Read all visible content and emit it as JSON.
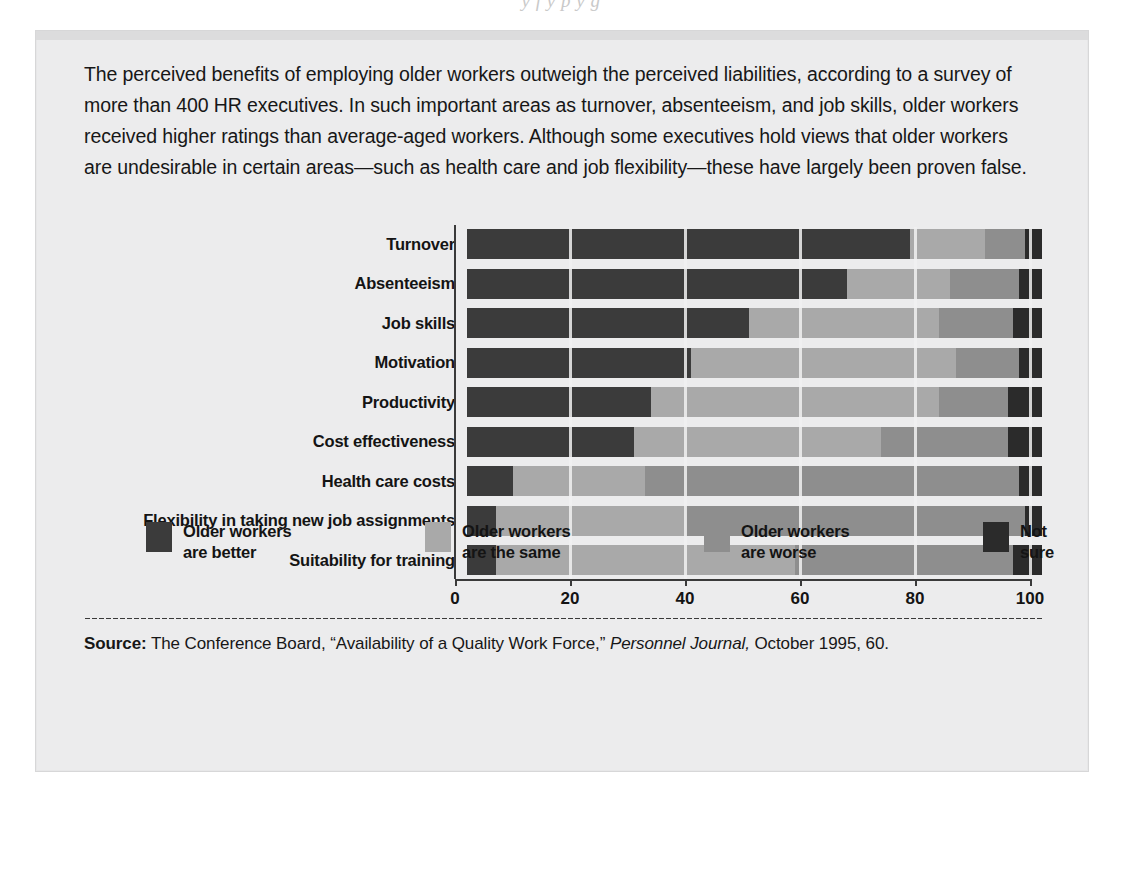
{
  "top_cut_text": "y  f  y  p  y  g",
  "intro": "The perceived benefits of employing older workers outweigh the perceived liabilities, according to a survey of more than 400 HR executives. In such important areas as turnover, absenteeism, and job skills, older workers received higher ratings than average-aged workers. Although some executives hold views that older workers are undesirable in certain areas—such as health care and job flexibility—these have largely  been proven false.",
  "legend": [
    {
      "label": "Older workers\nare better",
      "color": "#3b3b3b",
      "key": "better"
    },
    {
      "label": "Older workers\nare the same",
      "color": "#a9a9a9",
      "key": "same"
    },
    {
      "label": "Older workers\nare worse",
      "color": "#8e8e8e",
      "key": "worse"
    },
    {
      "label": "Not sure",
      "color": "#2b2b2b",
      "key": "notsure"
    }
  ],
  "source": {
    "prefix": "Source:",
    "part1": " The Conference Board, “Availability of a Quality Work Force,” ",
    "italic": "Personnel Journal,",
    "part2": " October 1995,  60."
  },
  "chart_data": {
    "type": "bar",
    "orientation": "horizontal",
    "stacked": true,
    "title": "",
    "xlabel": "",
    "ylabel": "",
    "xlim": [
      0,
      100
    ],
    "xticks": [
      0,
      20,
      40,
      60,
      80,
      100
    ],
    "xtick_labels": [
      "0",
      "20",
      "40",
      "60",
      "80",
      "100"
    ],
    "grid": false,
    "legend_position": "bottom",
    "categories": [
      "Turnover",
      "Absenteeism",
      "Job skills",
      "Motivation",
      "Productivity",
      "Cost effectiveness",
      "Health care costs",
      "Flexibility in taking new job assignments",
      "Suitability for training"
    ],
    "series": [
      {
        "name": "Older workers are better",
        "color": "#3b3b3b",
        "values": [
          77,
          66,
          49,
          39,
          32,
          29,
          8,
          5,
          5
        ]
      },
      {
        "name": "Older workers are the same",
        "color": "#a9a9a9",
        "values": [
          13,
          18,
          33,
          46,
          50,
          43,
          23,
          33,
          52
        ]
      },
      {
        "name": "Older workers are worse",
        "color": "#8e8e8e",
        "values": [
          7,
          12,
          13,
          11,
          12,
          22,
          65,
          59,
          38
        ]
      },
      {
        "name": "Not sure",
        "color": "#2b2b2b",
        "values": [
          3,
          4,
          5,
          4,
          6,
          6,
          4,
          3,
          5
        ]
      }
    ]
  }
}
